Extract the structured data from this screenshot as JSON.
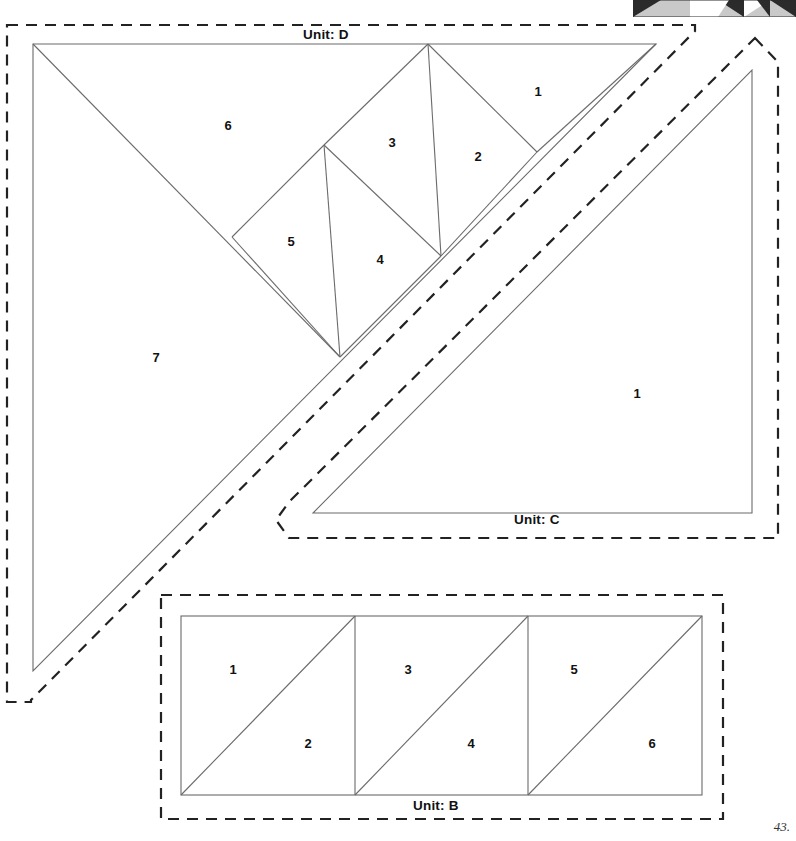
{
  "page": {
    "page_number": "43.",
    "background_color": "#ffffff",
    "line_color": "#6b6b6b",
    "dash_color": "#222222",
    "text_color": "#111111",
    "width": 796,
    "height": 841
  },
  "thumbnail": {
    "name": "quilt-block-strip",
    "x": 633,
    "y": 0,
    "width": 163,
    "height": 17,
    "colors": {
      "dark": "#2b2b2b",
      "light": "#c9c9c9",
      "mid": "#9a9a9a"
    },
    "cells": [
      {
        "x": 0,
        "w": 57,
        "style": "dark-tri-left"
      },
      {
        "x": 57,
        "w": 28,
        "style": "light"
      },
      {
        "x": 85,
        "w": 26,
        "style": "dark-tri-left"
      },
      {
        "x": 111,
        "w": 26,
        "style": "dark-tri-left"
      },
      {
        "x": 137,
        "w": 26,
        "style": "dark-tri-right"
      }
    ]
  },
  "units": [
    {
      "id": "D",
      "label": "Unit: D",
      "label_x": 303,
      "label_y": 27,
      "cut_outline": "M 7,25 L 695,25 L 695,31 L 31,700 L 31,702 L 7,702 Z",
      "seam_outline": "33,44 656,44 33,671",
      "seam_lines": [
        "M 33,44 L 340,357",
        "M 232,237 L 324,145",
        "M 324,145 L 428,44",
        "M 324,145 L 340,357",
        "M 324,145 L 441,256",
        "M 428,44 L 441,256",
        "M 428,44 L 537,152",
        "M 441,256 L 537,152",
        "M 340,357 L 441,256",
        "M 232,237 L 340,357",
        "M 537,152 L 656,44"
      ],
      "pieces": [
        {
          "n": "1",
          "x": 538,
          "y": 91
        },
        {
          "n": "2",
          "x": 478,
          "y": 156
        },
        {
          "n": "3",
          "x": 392,
          "y": 142
        },
        {
          "n": "4",
          "x": 380,
          "y": 259
        },
        {
          "n": "5",
          "x": 291,
          "y": 241
        },
        {
          "n": "6",
          "x": 228,
          "y": 125
        },
        {
          "n": "7",
          "x": 156,
          "y": 357
        }
      ]
    },
    {
      "id": "C",
      "label": "Unit: C",
      "label_x": 514,
      "label_y": 512,
      "cut_outline": "M 755,38 L 778,62 L 778,538 L 289,538 L 276,520 L 289,502 Z",
      "seam_outline": "752,70 752,513 313,513",
      "seam_lines": [],
      "pieces": [
        {
          "n": "1",
          "x": 637,
          "y": 393
        }
      ]
    },
    {
      "id": "B",
      "label": "Unit: B",
      "label_x": 413,
      "label_y": 798,
      "cut_outline": "M 161,595 L 723,595 L 723,819 L 161,819 Z",
      "seam_outline": "",
      "seam_lines": [
        "M 181,616 L 702,616",
        "M 181,795 L 702,795",
        "M 181,616 L 181,795",
        "M 355,616 L 355,795",
        "M 528,616 L 528,795",
        "M 702,616 L 702,795",
        "M 181,795 L 355,616",
        "M 355,795 L 528,616",
        "M 528,795 L 702,616"
      ],
      "pieces": [
        {
          "n": "1",
          "x": 233,
          "y": 669
        },
        {
          "n": "2",
          "x": 308,
          "y": 743
        },
        {
          "n": "3",
          "x": 408,
          "y": 669
        },
        {
          "n": "4",
          "x": 471,
          "y": 743
        },
        {
          "n": "5",
          "x": 574,
          "y": 669
        },
        {
          "n": "6",
          "x": 652,
          "y": 743
        }
      ]
    }
  ]
}
